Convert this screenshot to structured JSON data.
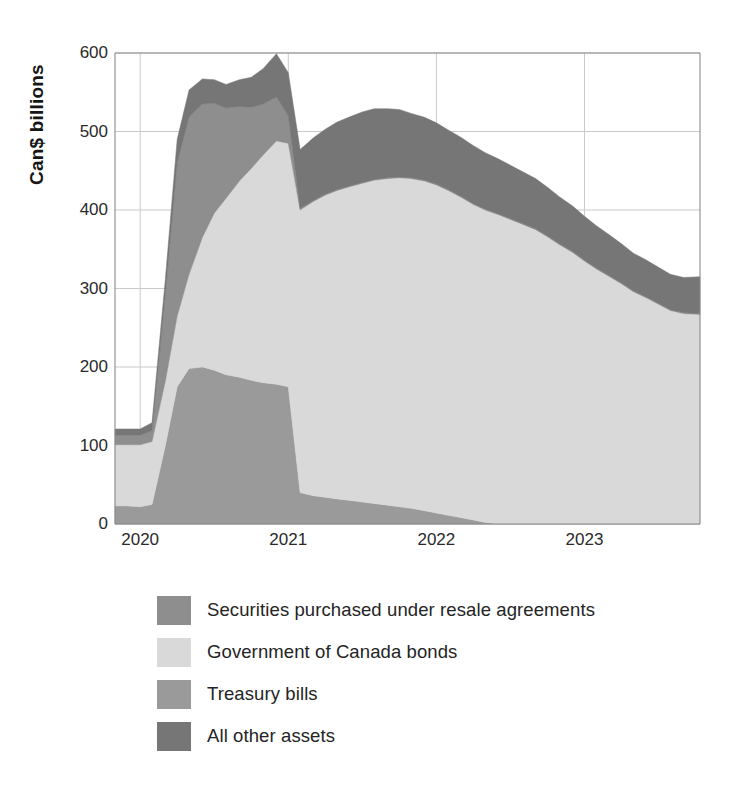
{
  "chart_data": {
    "type": "area",
    "stacked": true,
    "title": "",
    "subtitle": "",
    "xlabel": "",
    "ylabel": "Can$ billions",
    "ylim": [
      0,
      600
    ],
    "yticks": [
      0,
      100,
      200,
      300,
      400,
      500,
      600
    ],
    "ytick_labels": [
      "0",
      "100",
      "200",
      "300",
      "400",
      "500",
      "600"
    ],
    "xlim": [
      2019.83,
      2023.78
    ],
    "xticks": [
      2020,
      2021,
      2022,
      2023
    ],
    "xtick_labels": [
      "2020",
      "2021",
      "2022",
      "2023"
    ],
    "grid": true,
    "grid_axis": "both",
    "legend_position": "bottom-left",
    "x": [
      2019.83,
      2019.92,
      2020.0,
      2020.08,
      2020.17,
      2020.25,
      2020.33,
      2020.42,
      2020.5,
      2020.58,
      2020.67,
      2020.75,
      2020.83,
      2020.92,
      2021.0,
      2021.08,
      2021.17,
      2021.25,
      2021.33,
      2021.42,
      2021.5,
      2021.58,
      2021.67,
      2021.75,
      2021.83,
      2021.92,
      2022.0,
      2022.08,
      2022.17,
      2022.25,
      2022.33,
      2022.42,
      2022.5,
      2022.58,
      2022.67,
      2022.75,
      2022.83,
      2022.92,
      2023.0,
      2023.08,
      2023.17,
      2023.25,
      2023.33,
      2023.42,
      2023.5,
      2023.58,
      2023.67,
      2023.78
    ],
    "series": [
      {
        "name": "Treasury bills",
        "color": "#9a9a9a",
        "stack_order": 1,
        "values": [
          23,
          23,
          22,
          25,
          100,
          175,
          198,
          200,
          196,
          190,
          187,
          183,
          180,
          178,
          175,
          40,
          36,
          34,
          32,
          30,
          28,
          26,
          24,
          22,
          20,
          17,
          14,
          11,
          8,
          5,
          2,
          0,
          0,
          0,
          0,
          0,
          0,
          0,
          0,
          0,
          0,
          0,
          0,
          0,
          0,
          0,
          0,
          0
        ]
      },
      {
        "name": "Government of Canada bonds",
        "color": "#d9d9d9",
        "stack_order": 2,
        "values": [
          78,
          78,
          79,
          80,
          82,
          90,
          120,
          165,
          200,
          225,
          250,
          270,
          290,
          310,
          310,
          360,
          375,
          385,
          393,
          400,
          406,
          412,
          416,
          419,
          420,
          420,
          418,
          414,
          408,
          402,
          398,
          394,
          388,
          382,
          375,
          366,
          356,
          346,
          335,
          325,
          315,
          306,
          296,
          288,
          280,
          272,
          268,
          267
        ]
      },
      {
        "name": "Securities purchased under resale agreements",
        "color": "#8e8e8e",
        "stack_order": 3,
        "values": [
          12,
          12,
          12,
          14,
          110,
          195,
          200,
          170,
          140,
          115,
          95,
          78,
          65,
          56,
          35,
          2,
          1,
          1,
          1,
          1,
          1,
          1,
          1,
          1,
          1,
          1,
          1,
          1,
          1,
          1,
          1,
          1,
          1,
          1,
          1,
          1,
          1,
          1,
          1,
          1,
          1,
          1,
          1,
          1,
          1,
          1,
          1,
          1
        ]
      },
      {
        "name": "All other assets",
        "color": "#767676",
        "stack_order": 4,
        "values": [
          8,
          8,
          8,
          10,
          20,
          30,
          35,
          32,
          30,
          30,
          34,
          38,
          45,
          55,
          55,
          75,
          80,
          83,
          86,
          88,
          90,
          90,
          88,
          86,
          82,
          80,
          78,
          76,
          75,
          74,
          72,
          70,
          68,
          66,
          64,
          62,
          60,
          58,
          56,
          54,
          52,
          50,
          48,
          47,
          46,
          45,
          45,
          47
        ]
      }
    ],
    "totals_note": "Stacked totals peak near 575 in late 2020 and near 500 in late 2021"
  },
  "axis": {
    "ylabel": "Can$ billions"
  },
  "legend": {
    "items": [
      {
        "label": "Securities purchased under resale agreements",
        "color": "#8e8e8e"
      },
      {
        "label": "Government of Canada bonds",
        "color": "#d9d9d9"
      },
      {
        "label": "Treasury bills",
        "color": "#9a9a9a"
      },
      {
        "label": "All other assets",
        "color": "#767676"
      }
    ]
  },
  "colors": {
    "grid": "#c9c9c9",
    "axis": "#8a8a8a",
    "text": "#242424",
    "background": "#ffffff"
  }
}
